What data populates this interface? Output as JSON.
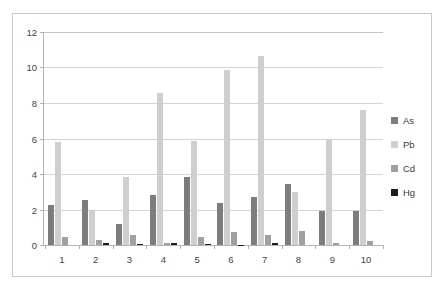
{
  "chart_data": {
    "type": "bar",
    "title": "",
    "xlabel": "",
    "ylabel": "",
    "ylim": [
      0,
      12
    ],
    "ytick_labels": [
      "0",
      "2",
      "4",
      "6",
      "8",
      "10",
      "12"
    ],
    "ytick_values": [
      0,
      2,
      4,
      6,
      8,
      10,
      12
    ],
    "grid": true,
    "legend_position": "right",
    "categories": [
      "1",
      "2",
      "3",
      "4",
      "5",
      "6",
      "7",
      "8",
      "9",
      "10"
    ],
    "series": [
      {
        "name": "As",
        "color": "#7d7d7d",
        "values": [
          2.25,
          2.55,
          1.2,
          2.8,
          3.8,
          2.35,
          2.7,
          3.4,
          1.9,
          1.9
        ]
      },
      {
        "name": "Pb",
        "color": "#cfcfcf",
        "values": [
          5.75,
          1.95,
          3.8,
          8.5,
          5.85,
          9.8,
          10.6,
          2.95,
          5.9,
          7.55
        ]
      },
      {
        "name": "Cd",
        "color": "#a0a0a0",
        "values": [
          0.45,
          0.3,
          0.55,
          0.1,
          0.45,
          0.75,
          0.55,
          0.8,
          0.1,
          0.2
        ]
      },
      {
        "name": "Hg",
        "color": "#1c1c1c",
        "values": [
          0.0,
          0.12,
          0.05,
          0.1,
          0.04,
          0.02,
          0.12,
          0.0,
          0.0,
          0.0
        ]
      }
    ]
  },
  "legend": {
    "items": [
      {
        "label": "As"
      },
      {
        "label": "Pb"
      },
      {
        "label": "Cd"
      },
      {
        "label": "Hg"
      }
    ]
  },
  "colors": {
    "as": "#7d7d7d",
    "pb": "#cfcfcf",
    "cd": "#a0a0a0",
    "hg": "#1c1c1c",
    "gridline": "#d4d4d4",
    "axis": "#b3b3b3",
    "border": "#c9c9c9",
    "text": "#444444"
  }
}
